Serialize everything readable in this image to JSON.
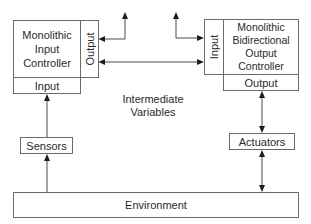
{
  "diagram": {
    "left_controller": {
      "title_lines": [
        "Monolithic",
        "Input",
        "Controller"
      ],
      "side_label": "Output",
      "bottom_label": "Input"
    },
    "right_controller": {
      "title_lines": [
        "Monolithic",
        "Bidirectional",
        "Output",
        "Controller"
      ],
      "side_label": "Input",
      "bottom_label": "Output"
    },
    "middle_label_lines": [
      "Intermediate",
      "Variables"
    ],
    "sensors_label": "Sensors",
    "actuators_label": "Actuators",
    "environment_label": "Environment",
    "colors": {
      "stroke": "#6b6b6b",
      "arrow": "#1e1e1e",
      "text": "#2a2a2a",
      "background": "#ffffff"
    }
  }
}
